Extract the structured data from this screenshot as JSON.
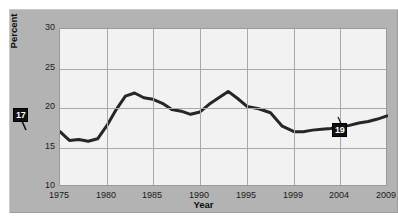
{
  "axes": {
    "ylabel": "Percent",
    "xlabel": "Year",
    "yticks": [
      "10",
      "15",
      "20",
      "25",
      "30"
    ],
    "xticks": [
      "1975",
      "1980",
      "1985",
      "1990",
      "1995",
      "1999",
      "2004",
      "2009"
    ]
  },
  "annotations": {
    "start_value": "17",
    "end_value": "19"
  },
  "colors": {
    "panel": "#b3b3b3",
    "plot_background": "#f2f2f2",
    "gridline": "#a9a9a9",
    "series_line": "#262626",
    "callout_background": "#111111",
    "callout_text": "#ffffff"
  },
  "chart_data": {
    "type": "line",
    "title": "",
    "xlabel": "Year",
    "ylabel": "Percent",
    "xlim": [
      1975,
      2009
    ],
    "ylim": [
      10,
      30
    ],
    "grid": true,
    "legend": null,
    "xticks": [
      1975,
      1980,
      1985,
      1990,
      1995,
      1999,
      2004,
      2009
    ],
    "yticks": [
      10,
      15,
      20,
      25,
      30
    ],
    "series": [
      {
        "name": "Percent",
        "x": [
          1975,
          1976,
          1977,
          1978,
          1979,
          1980,
          1981,
          1982,
          1983,
          1984,
          1985,
          1986,
          1987,
          1988,
          1989,
          1990,
          1991,
          1992,
          1993,
          1994,
          1995,
          1996,
          1997,
          1998,
          1999,
          2000,
          2001,
          2002,
          2003,
          2004,
          2005,
          2006,
          2007,
          2008,
          2009
        ],
        "values": [
          17.0,
          15.9,
          16.0,
          15.8,
          16.1,
          17.8,
          19.8,
          21.5,
          21.9,
          21.3,
          21.1,
          20.6,
          19.8,
          19.6,
          19.2,
          19.5,
          20.5,
          21.3,
          22.1,
          21.2,
          20.2,
          19.9,
          19.4,
          17.7,
          17.0,
          17.0,
          17.2,
          17.3,
          17.4,
          17.6,
          17.8,
          18.1,
          18.3,
          18.6,
          19.0
        ]
      }
    ],
    "annotations": [
      {
        "label": "17",
        "x": 1975,
        "y": 17.0
      },
      {
        "label": "19",
        "x": 2009,
        "y": 19.0
      }
    ]
  }
}
